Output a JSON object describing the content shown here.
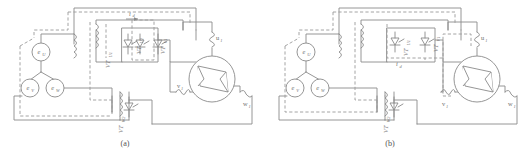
{
  "figure": {
    "background_color": "#ffffff",
    "line_color": "#8a8a8a",
    "dashed_color": "#9a9a9a",
    "text_color": "#6e6e6e",
    "panels": [
      {
        "id": "a",
        "caption": "(a)",
        "sources": [
          {
            "name": "source-eu",
            "symbol": "e",
            "subscript": "U"
          },
          {
            "name": "source-ev",
            "symbol": "e",
            "subscript": "V"
          },
          {
            "name": "source-ew",
            "symbol": "e",
            "subscript": "W"
          }
        ],
        "thyristors": [
          {
            "name": "thyristor-vtu1",
            "symbol": "VT",
            "subscript": "U1"
          },
          {
            "name": "thyristor-vtu2",
            "symbol": "VT",
            "subscript": "U2"
          },
          {
            "name": "thyristor-vtv1",
            "symbol": "VT",
            "subscript": "V1"
          },
          {
            "name": "thyristor-vtw2",
            "symbol": "VT",
            "subscript": "W2"
          }
        ],
        "current_label": {
          "symbol": "i",
          "subscript": "d"
        },
        "motor_windings": [
          {
            "name": "winding-u1",
            "symbol": "u",
            "subscript": "1"
          },
          {
            "name": "winding-v1",
            "symbol": "v",
            "subscript": "1"
          },
          {
            "name": "winding-w1",
            "symbol": "w",
            "subscript": "1"
          }
        ]
      },
      {
        "id": "b",
        "caption": "(b)",
        "sources": [
          {
            "name": "source-eu",
            "symbol": "e",
            "subscript": "U"
          },
          {
            "name": "source-ev",
            "symbol": "e",
            "subscript": "V"
          },
          {
            "name": "source-ew",
            "symbol": "e",
            "subscript": "W"
          }
        ],
        "thyristors": [
          {
            "name": "thyristor-vtu1",
            "symbol": "VT",
            "subscript": "U1"
          },
          {
            "name": "thyristor-vtv1",
            "symbol": "VT",
            "subscript": "V1"
          },
          {
            "name": "thyristor-vtw2",
            "symbol": "VT",
            "subscript": "W2"
          }
        ],
        "current_label": {
          "symbol": "i",
          "subscript": "d"
        },
        "motor_windings": [
          {
            "name": "winding-u1",
            "symbol": "u",
            "subscript": "1"
          },
          {
            "name": "winding-v1",
            "symbol": "v",
            "subscript": "1"
          },
          {
            "name": "winding-w1",
            "symbol": "w",
            "subscript": "1"
          }
        ]
      }
    ]
  }
}
